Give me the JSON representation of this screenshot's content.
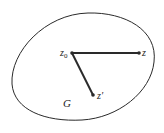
{
  "diagram": {
    "region_label": "G",
    "points": [
      {
        "id": "z0",
        "label": "z",
        "subscript": "0",
        "x": 72,
        "y": 53
      },
      {
        "id": "z",
        "label": "z",
        "subscript": "",
        "x": 139,
        "y": 53
      },
      {
        "id": "zprime",
        "label": "z′",
        "subscript": "",
        "x": 93,
        "y": 95
      }
    ],
    "segments": [
      {
        "from": "z0",
        "to": "z"
      },
      {
        "from": "z0",
        "to": "zprime"
      }
    ],
    "colors": {
      "stroke": "#2a2a2a",
      "background": "#ffffff"
    }
  }
}
